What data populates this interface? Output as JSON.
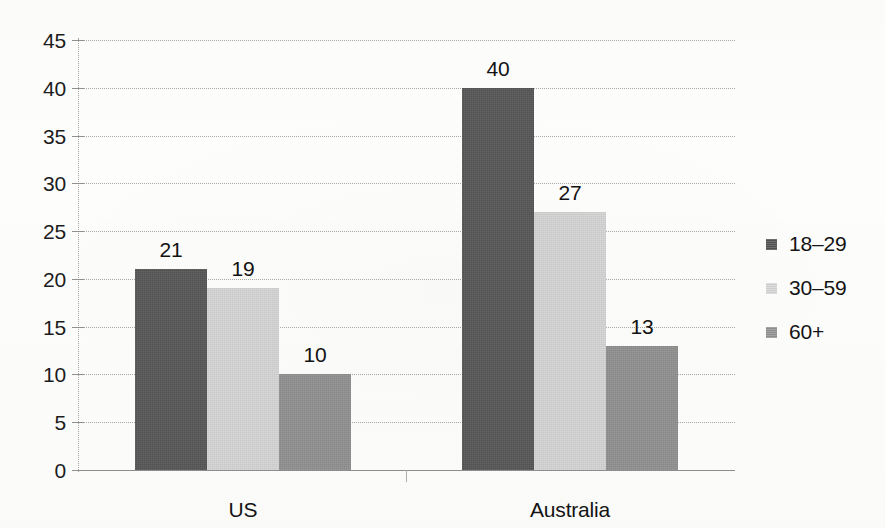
{
  "chart_data": {
    "type": "bar",
    "title": "",
    "subtitle": "",
    "xlabel": "",
    "ylabel": "",
    "categories": [
      "US",
      "Australia"
    ],
    "series": [
      {
        "name": "18–29",
        "values": [
          21,
          40
        ],
        "color": "#565656"
      },
      {
        "name": "30–59",
        "values": [
          19,
          27
        ],
        "color": "#d4d4d4"
      },
      {
        "name": "60+",
        "values": [
          10,
          13
        ],
        "color": "#8f8f8f"
      }
    ],
    "ylim": [
      0,
      45
    ],
    "ytick_step": 5,
    "yticks": [
      0,
      5,
      10,
      15,
      20,
      25,
      30,
      35,
      40,
      45
    ],
    "ytick_labels": [
      "0",
      "5",
      "10",
      "15",
      "20",
      "25",
      "30",
      "35",
      "40",
      "45"
    ],
    "grid": true,
    "grid_axis": "y",
    "grid_style": "dotted",
    "legend_position": "right",
    "bar_value_labels": true,
    "bar_gap_within_group": 0,
    "background_color": "#fdfdfc",
    "text_color": "#141414"
  },
  "axis": {
    "y_tick_labels": [
      "45",
      "40",
      "35",
      "30",
      "25",
      "20",
      "15",
      "10",
      "5",
      "0"
    ],
    "x_tick_labels": [
      "US",
      "Australia"
    ]
  },
  "bars": [
    {
      "group": "US",
      "series": "18–29",
      "value": 21,
      "label": "21"
    },
    {
      "group": "US",
      "series": "30–59",
      "value": 19,
      "label": "19"
    },
    {
      "group": "US",
      "series": "60+",
      "value": 10,
      "label": "10"
    },
    {
      "group": "Australia",
      "series": "18–29",
      "value": 40,
      "label": "40"
    },
    {
      "group": "Australia",
      "series": "30–59",
      "value": 27,
      "label": "27"
    },
    {
      "group": "Australia",
      "series": "60+",
      "value": 13,
      "label": "13"
    }
  ],
  "legend": {
    "items": [
      {
        "label": "18–29",
        "color": "#565656"
      },
      {
        "label": "30–59",
        "color": "#d4d4d4"
      },
      {
        "label": "60+",
        "color": "#959595"
      }
    ]
  }
}
